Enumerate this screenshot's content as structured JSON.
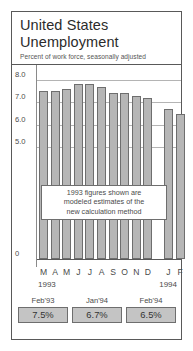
{
  "header": {
    "title_line1": "United States",
    "title_line2": "Unemployment",
    "subtitle": "Percent of work force, seasonally adjusted"
  },
  "annotation": {
    "line1": "1993 figures shown are",
    "line2": "modeled estimates of the",
    "line3": "new calculation method"
  },
  "axis": {
    "year_left": "1993",
    "year_right": "1994"
  },
  "callouts": [
    {
      "label": "Feb'93",
      "value": "7.5%"
    },
    {
      "label": "Jan'94",
      "value": "6.7%"
    },
    {
      "label": "Feb'94",
      "value": "6.5%"
    }
  ],
  "colors": {
    "bar_fill": "#b6b6b6",
    "bar_stroke": "#6e6e6e",
    "frame": "#595959",
    "grid": "#b4b4b4",
    "callout_fill": "#c4c4c4",
    "text": "#4a4a4a"
  },
  "chart_data": {
    "type": "bar",
    "title": "United States Unemployment",
    "subtitle": "Percent of work force, seasonally adjusted",
    "xlabel": "",
    "ylabel": "Percent of work force, seasonally adjusted",
    "ylim": [
      0,
      8.0
    ],
    "yticks": [
      0,
      5.0,
      6.0,
      7.0,
      8.0
    ],
    "ytick_labels": [
      "0",
      "5.0",
      "6.0",
      "7.0",
      "8.0"
    ],
    "grid": true,
    "legend": false,
    "categories": [
      "M",
      "A",
      "M",
      "J",
      "J",
      "A",
      "S",
      "O",
      "N",
      "D",
      "J",
      "F"
    ],
    "category_years": [
      "1993",
      "1993",
      "1993",
      "1993",
      "1993",
      "1993",
      "1993",
      "1993",
      "1993",
      "1993",
      "1994",
      "1994"
    ],
    "values": [
      7.5,
      7.5,
      7.6,
      7.8,
      7.8,
      7.7,
      7.4,
      7.4,
      7.3,
      7.2,
      6.7,
      6.5
    ],
    "annotations": [
      "1993 figures shown are modeled estimates of the new calculation method"
    ],
    "highlighted": [
      {
        "label": "Feb'93",
        "value": 7.5
      },
      {
        "label": "Jan'94",
        "value": 6.7
      },
      {
        "label": "Feb'94",
        "value": 6.5
      }
    ]
  }
}
